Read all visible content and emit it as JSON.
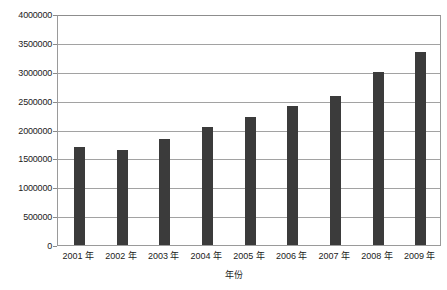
{
  "chart_data": {
    "type": "bar",
    "title": "",
    "xlabel": "年份",
    "ylabel": "",
    "categories": [
      "2001 年",
      "2002 年",
      "2003 年",
      "2004 年",
      "2005 年",
      "2006 年",
      "2007 年",
      "2008 年",
      "2009 年"
    ],
    "values": [
      1700000,
      1650000,
      1830000,
      2050000,
      2220000,
      2400000,
      2580000,
      3000000,
      3350000
    ],
    "ylim": [
      0,
      4000000
    ],
    "yticks": [
      0,
      500000,
      1000000,
      1500000,
      2000000,
      2500000,
      3000000,
      3500000,
      4000000
    ],
    "ytick_labels": [
      "0",
      "500000",
      "1000000",
      "1500000",
      "2000000",
      "2500000",
      "3000000",
      "3500000",
      "4000000"
    ],
    "grid": true,
    "legend": null,
    "series_color": "#3b3b3b",
    "gridline_color": "#a2a2a2",
    "frame_color": "#9a9a9a"
  }
}
